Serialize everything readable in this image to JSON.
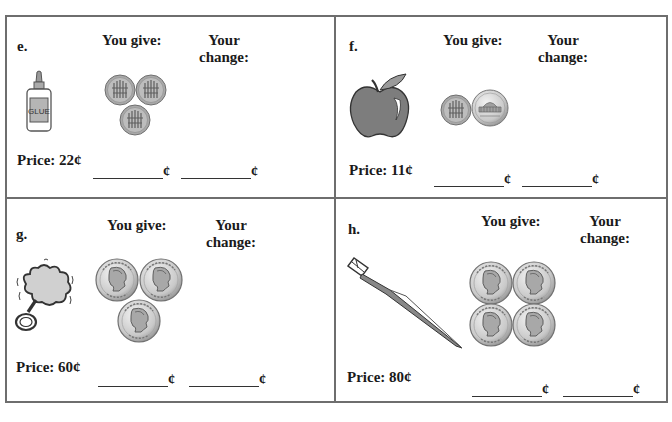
{
  "labels": {
    "you_give": "You give:",
    "your_change_line1": "Your",
    "your_change_line2": "change:",
    "cent_sign": "¢"
  },
  "problems": [
    {
      "letter": "e.",
      "item": "glue-bottle",
      "item_text": "GLUE",
      "price": "Price: 22¢",
      "coins_given": [
        "dime",
        "dime",
        "dime"
      ]
    },
    {
      "letter": "f.",
      "item": "apple",
      "price": "Price: 11¢",
      "coins_given": [
        "dime",
        "nickel"
      ]
    },
    {
      "letter": "g.",
      "item": "bubble-wand",
      "price": "Price: 60¢",
      "coins_given": [
        "quarter",
        "quarter",
        "quarter"
      ]
    },
    {
      "letter": "h.",
      "item": "toothbrush",
      "price": "Price: 80¢",
      "coins_given": [
        "quarter",
        "quarter",
        "quarter",
        "quarter"
      ]
    }
  ],
  "colors": {
    "border": "#6e6e6e",
    "coin_fill": "#c8c8c8",
    "coin_edge": "#7a7a7a",
    "apple": "#7d7d7d"
  }
}
